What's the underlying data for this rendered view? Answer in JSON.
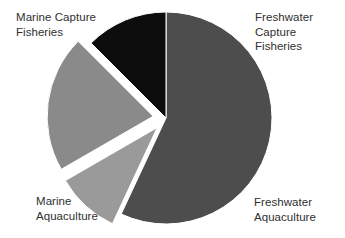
{
  "chart_data": {
    "type": "pie",
    "title": "",
    "subtitle": "",
    "xlabel": "",
    "ylabel": "",
    "grid": false,
    "legend_position": "none",
    "labels_position": "outside",
    "categories": [
      "Marine Capture Fisheries",
      "Freshwater Capture Fisheries",
      "Freshwater Aquaculture",
      "Marine Aquaculture"
    ],
    "values": [
      57,
      10,
      21,
      12
    ],
    "units": "percent",
    "colors": [
      "#4d4d4d",
      "#9a9a9a",
      "#8a8a8a",
      "#0d0d0d"
    ],
    "exploded": [
      false,
      true,
      true,
      false
    ],
    "slices": [
      {
        "name": "Marine Capture Fisheries",
        "value": 57,
        "color": "#4d4d4d",
        "exploded": false,
        "start_angle_deg": 0,
        "end_angle_deg": 205,
        "label_lines": [
          "Marine Capture",
          "Fisheries"
        ]
      },
      {
        "name": "Freshwater Capture Fisheries",
        "value": 10,
        "color": "#9a9a9a",
        "exploded": true,
        "start_angle_deg": 205,
        "end_angle_deg": 240,
        "label_lines": [
          "Freshwater",
          "Capture",
          "Fisheries"
        ]
      },
      {
        "name": "Freshwater Aquaculture",
        "value": 21,
        "color": "#8a8a8a",
        "exploded": true,
        "start_angle_deg": 240,
        "end_angle_deg": 315,
        "label_lines": [
          "Freshwater",
          "Aquaculture"
        ]
      },
      {
        "name": "Marine Aquaculture",
        "value": 12,
        "color": "#0d0d0d",
        "exploded": false,
        "start_angle_deg": 315,
        "end_angle_deg": 360,
        "label_lines": [
          "Marine",
          "Aquaculture"
        ]
      }
    ],
    "background_color": "#ffffff",
    "text_color": "#2f2f2f"
  },
  "labels": {
    "marine_capture": "Marine Capture\nFisheries",
    "freshwater_capture": "Freshwater\nCapture\nFisheries",
    "freshwater_aquaculture": "Freshwater\nAquaculture",
    "marine_aquaculture": "Marine\nAquaculture"
  }
}
